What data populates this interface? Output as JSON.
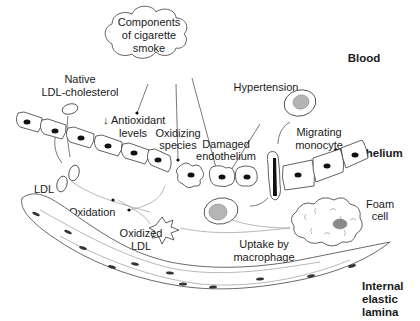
{
  "figure": {
    "regions": {
      "blood": "Blood",
      "endothelium": "Endothelium",
      "internal_elastic_lamina": [
        "Internal",
        "elastic",
        "lamina"
      ]
    },
    "cloud": {
      "lines": [
        "Components",
        "of cigarette",
        "smoke"
      ]
    },
    "labels": {
      "native_ldl": [
        "Native",
        "LDL-cholesterol"
      ],
      "antioxidant": [
        "↓ Antioxidant",
        "levels"
      ],
      "oxidizing_species": [
        "Oxidizing",
        "species"
      ],
      "damaged_endothelium": [
        "Damaged",
        "endothelium"
      ],
      "hypertension": "Hypertension",
      "migrating_monocyte": [
        "Migrating",
        "monocyte"
      ],
      "ldl": "LDL",
      "oxidation": "Oxidation",
      "oxidized_ldl": [
        "Oxidized",
        "LDL"
      ],
      "uptake_by_macrophage": [
        "Uptake by",
        "macrophage"
      ],
      "foam_cell": [
        "Foam",
        "cell"
      ]
    },
    "colors": {
      "line": "#555555",
      "nucleus": "#111111",
      "monocyte_nucleus": "#b5b5b5",
      "background": "#ffffff"
    }
  }
}
